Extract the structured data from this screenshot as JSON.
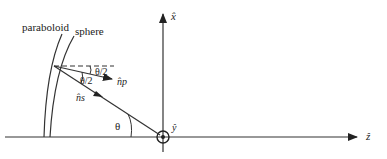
{
  "labels": {
    "paraboloid": "paraboloid",
    "sphere": "sphere",
    "half_angle_top": "θ/2",
    "half_angle_bottom": "θ/2",
    "n_p": "n̂p",
    "n_s": "n̂s",
    "theta": "θ",
    "x_axis": "x̂",
    "y_axis": "ŷ",
    "z_axis": "ẑ"
  }
}
